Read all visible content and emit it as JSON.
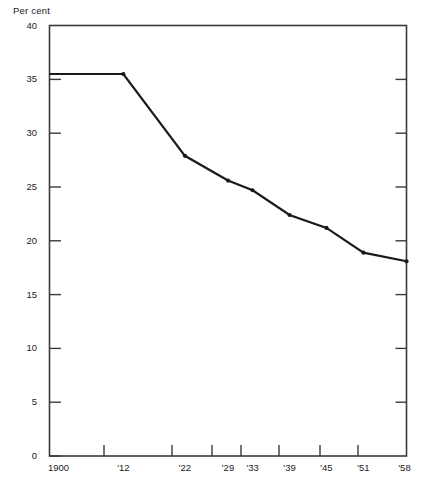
{
  "chart_data": {
    "type": "line",
    "title": "",
    "subtitle": "",
    "ylabel": "Per cent",
    "xlabel": "",
    "grid": false,
    "legend": "none",
    "ylim": [
      0,
      40
    ],
    "yticks": [
      0,
      5,
      10,
      15,
      20,
      25,
      30,
      35,
      40
    ],
    "ytick_labels": [
      "0",
      "5",
      "10",
      "15",
      "20",
      "25",
      "30",
      "35",
      "40"
    ],
    "x_categories": [
      "1900",
      "'12",
      "'22",
      "'29",
      "'33",
      "'39",
      "'45",
      "'51",
      "'58"
    ],
    "x_positions": [
      1900,
      1912,
      1922,
      1929,
      1933,
      1939,
      1945,
      1951,
      1958
    ],
    "xlim": [
      1900,
      1958
    ],
    "series": [
      {
        "name": "Per cent",
        "values": [
          35.5,
          35.5,
          27.9,
          25.6,
          24.7,
          22.4,
          21.2,
          18.9,
          18.1
        ],
        "color": "#1a1a1a",
        "marker": "dot",
        "line_width": 2.2
      }
    ],
    "annotations": [],
    "axis_color": "#3a3a3a",
    "frame": "box",
    "tick_direction": "inward-right-outward-left"
  },
  "figure": {
    "caption_faint": ""
  }
}
